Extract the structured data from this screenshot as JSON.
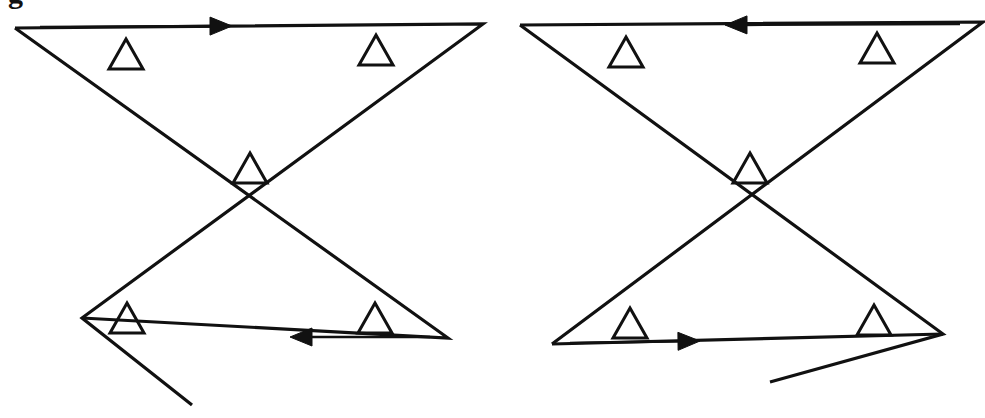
{
  "figure": {
    "caption_fragment": "g",
    "background_color": "#ffffff",
    "stroke_color": "#111111",
    "panel_count": 2
  },
  "chart_data": {
    "type": "diagram",
    "title": "",
    "xlabel": "",
    "ylabel": "",
    "grid": false,
    "legend": "none",
    "xlim": [
      0,
      985
    ],
    "ylim": [
      418,
      0
    ],
    "stroke_width": 3.2,
    "stroke_color": "#111111",
    "panels": [
      {
        "name": "left-panel",
        "label": "left",
        "top_arrow_direction": "right",
        "bottom_arrow_direction": "left",
        "polyline_a": [
          [
            15,
            28
          ],
          [
            483,
            24
          ],
          [
            82,
            318
          ],
          [
            192,
            405
          ]
        ],
        "polyline_b": [
          [
            15,
            28
          ],
          [
            448,
            338
          ],
          [
            82,
            318
          ]
        ],
        "vertices": [
          {
            "name": "top-left-vertex",
            "x": 15,
            "y": 28
          },
          {
            "name": "top-right-vertex",
            "x": 483,
            "y": 24
          },
          {
            "name": "bottom-left-vertex",
            "x": 82,
            "y": 318
          },
          {
            "name": "bottom-right-vertex",
            "x": 448,
            "y": 338
          },
          {
            "name": "tail-end-vertex",
            "x": 192,
            "y": 405
          }
        ],
        "arrows": [
          {
            "name": "top-arrow",
            "x1": 40,
            "y1": 27,
            "x2": 232,
            "y2": 26,
            "direction": "right"
          },
          {
            "name": "bottom-arrow",
            "x1": 430,
            "y1": 337,
            "x2": 290,
            "y2": 337,
            "direction": "left"
          }
        ],
        "triangles": [
          {
            "name": "triangle-top-left",
            "cx": 126,
            "cy": 54,
            "size": 34
          },
          {
            "name": "triangle-top-right",
            "cx": 376,
            "cy": 50,
            "size": 34
          },
          {
            "name": "triangle-center",
            "cx": 250,
            "cy": 168,
            "size": 34
          },
          {
            "name": "triangle-bottom-left",
            "cx": 127,
            "cy": 318,
            "size": 34
          },
          {
            "name": "triangle-bottom-right",
            "cx": 375,
            "cy": 318,
            "size": 34
          }
        ]
      },
      {
        "name": "right-panel",
        "label": "right",
        "top_arrow_direction": "left",
        "bottom_arrow_direction": "right",
        "polyline_a": [
          [
            520,
            25
          ],
          [
            983,
            22
          ],
          [
            552,
            344
          ]
        ],
        "polyline_b": [
          [
            520,
            25
          ],
          [
            943,
            334
          ],
          [
            770,
            382
          ]
        ],
        "polyline_c": [
          [
            552,
            344
          ],
          [
            943,
            334
          ]
        ],
        "vertices": [
          {
            "name": "top-left-vertex",
            "x": 520,
            "y": 25
          },
          {
            "name": "top-right-vertex",
            "x": 983,
            "y": 22
          },
          {
            "name": "bottom-left-vertex",
            "x": 552,
            "y": 344
          },
          {
            "name": "bottom-right-vertex",
            "x": 943,
            "y": 334
          },
          {
            "name": "tail-end-vertex",
            "x": 770,
            "y": 382
          }
        ],
        "arrows": [
          {
            "name": "top-arrow",
            "x1": 960,
            "y1": 24,
            "x2": 725,
            "y2": 25,
            "direction": "left"
          },
          {
            "name": "bottom-arrow",
            "x1": 570,
            "y1": 343,
            "x2": 700,
            "y2": 341,
            "direction": "right"
          }
        ],
        "triangles": [
          {
            "name": "triangle-top-left",
            "cx": 626,
            "cy": 52,
            "size": 34
          },
          {
            "name": "triangle-top-right",
            "cx": 877,
            "cy": 48,
            "size": 34
          },
          {
            "name": "triangle-center",
            "cx": 750,
            "cy": 168,
            "size": 34
          },
          {
            "name": "triangle-bottom-left",
            "cx": 630,
            "cy": 323,
            "size": 34
          },
          {
            "name": "triangle-bottom-right",
            "cx": 874,
            "cy": 320,
            "size": 34
          }
        ]
      }
    ]
  }
}
